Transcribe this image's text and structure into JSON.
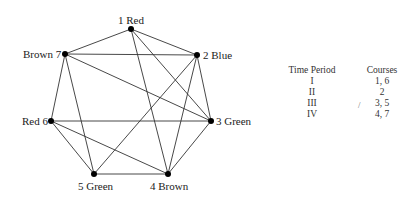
{
  "graph": {
    "nodes": [
      {
        "id": 1,
        "label": "1 Red",
        "color": "Red",
        "x": 131,
        "y": 29
      },
      {
        "id": 2,
        "label": "2 Blue",
        "color": "Blue",
        "x": 197,
        "y": 55
      },
      {
        "id": 3,
        "label": "3 Green",
        "color": "Green",
        "x": 211,
        "y": 121
      },
      {
        "id": 4,
        "label": "4 Brown",
        "color": "Brown",
        "x": 168,
        "y": 174
      },
      {
        "id": 5,
        "label": "5 Green",
        "color": "Green",
        "x": 94,
        "y": 174
      },
      {
        "id": 6,
        "label": "Red 6",
        "color": "Red",
        "x": 51,
        "y": 121
      },
      {
        "id": 7,
        "label": "Brown 7",
        "color": "Brown",
        "x": 65,
        "y": 54
      }
    ],
    "edges": [
      [
        1,
        7
      ],
      [
        1,
        2
      ],
      [
        1,
        4
      ],
      [
        1,
        3
      ],
      [
        7,
        2
      ],
      [
        7,
        3
      ],
      [
        7,
        6
      ],
      [
        7,
        5
      ],
      [
        2,
        5
      ],
      [
        2,
        4
      ],
      [
        2,
        3
      ],
      [
        3,
        6
      ],
      [
        3,
        4
      ],
      [
        6,
        5
      ],
      [
        6,
        4
      ],
      [
        5,
        4
      ]
    ]
  },
  "table": {
    "headers": [
      "Time Period",
      "Courses"
    ],
    "rows": [
      [
        "I",
        "1, 6"
      ],
      [
        "II",
        "2"
      ],
      [
        "III",
        "3, 5"
      ],
      [
        "IV",
        "4, 7"
      ]
    ]
  },
  "annotation_mark": "/"
}
